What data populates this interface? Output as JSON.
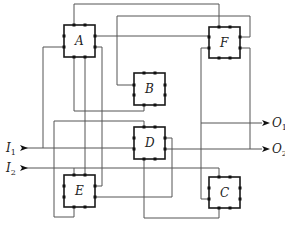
{
  "diagram": {
    "type": "block-interconnect",
    "modules": [
      {
        "id": "A",
        "label": "A"
      },
      {
        "id": "B",
        "label": "B"
      },
      {
        "id": "C",
        "label": "C"
      },
      {
        "id": "D",
        "label": "D"
      },
      {
        "id": "E",
        "label": "E"
      },
      {
        "id": "F",
        "label": "F"
      }
    ],
    "inputs": [
      {
        "id": "I1",
        "letter": "I",
        "sub": "1"
      },
      {
        "id": "I2",
        "letter": "I",
        "sub": "2"
      }
    ],
    "outputs": [
      {
        "id": "O1",
        "letter": "O",
        "sub": "1"
      },
      {
        "id": "O2",
        "letter": "O",
        "sub": "2"
      }
    ],
    "colors": {
      "wire": "#555555",
      "box_border": "#1a1a1a",
      "pin": "#111111",
      "background": "#ffffff"
    }
  }
}
